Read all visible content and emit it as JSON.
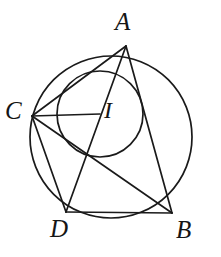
{
  "figure": {
    "kind": "geometry-diagram",
    "background_color": "#ffffff",
    "stroke_color": "#1a1a1a",
    "labels": {
      "A": "A",
      "B": "B",
      "C": "C",
      "D": "D",
      "I": "I"
    },
    "points": {
      "A": {
        "x": 126,
        "y": 46
      },
      "B": {
        "x": 172,
        "y": 213
      },
      "C": {
        "x": 32,
        "y": 116
      },
      "D": {
        "x": 66,
        "y": 212
      },
      "I": {
        "x": 100,
        "y": 114
      }
    },
    "circles": [
      {
        "name": "circumcircle",
        "cx": 111,
        "cy": 137,
        "r": 81
      },
      {
        "name": "inner-circle",
        "cx": 100,
        "cy": 114,
        "r": 43
      }
    ],
    "segments": [
      {
        "name": "segment-A-C",
        "from": "A",
        "to": "C"
      },
      {
        "name": "segment-A-B",
        "from": "A",
        "to": "B"
      },
      {
        "name": "segment-A-D",
        "from": "A",
        "to": "D"
      },
      {
        "name": "segment-C-B",
        "from": "C",
        "to": "B"
      },
      {
        "name": "segment-C-D",
        "from": "C",
        "to": "D"
      },
      {
        "name": "segment-D-B",
        "from": "D",
        "to": "B"
      },
      {
        "name": "segment-C-I",
        "from": "C",
        "to": "I"
      }
    ]
  }
}
